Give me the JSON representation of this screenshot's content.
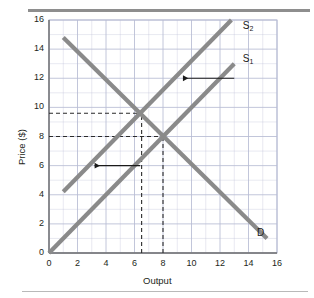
{
  "figure": {
    "title": "",
    "axis": {
      "x_title": "Output",
      "y_title": "Price ($)",
      "x_ticks": [
        "0",
        "2",
        "4",
        "6",
        "8",
        "10",
        "12",
        "14",
        "16"
      ],
      "y_ticks": [
        "0",
        "2",
        "4",
        "6",
        "8",
        "10",
        "12",
        "14",
        "16"
      ]
    },
    "labels": {
      "supply_1": "S",
      "supply_1_sub": "1",
      "supply_2": "S",
      "supply_2_sub": "2",
      "demand": "D"
    },
    "colors": {
      "curve": "#8a8a8a",
      "grid": "#b7bcd4",
      "axis": "#6e6e6e",
      "text": "#231f20",
      "dash": "#2a2a2a",
      "arrow": "#1a1a1a",
      "rule_top": "#8e8e8e",
      "rule_bottom": "#b9b9b9"
    }
  },
  "chart_data": {
    "type": "line",
    "xlabel": "Output",
    "ylabel": "Price ($)",
    "xlim": [
      0,
      16
    ],
    "ylim": [
      0,
      16
    ],
    "xticks": [
      0,
      2,
      4,
      6,
      8,
      10,
      12,
      14,
      16
    ],
    "yticks": [
      0,
      2,
      4,
      6,
      8,
      10,
      12,
      14,
      16
    ],
    "grid": true,
    "minor_grid_step": 1,
    "major_grid_step": 2,
    "legend": "inline-labels",
    "series": [
      {
        "name": "D",
        "label": "D",
        "label_point": [
          14.6,
          1.4
        ],
        "points": [
          [
            1.0,
            14.8
          ],
          [
            15.3,
            1.0
          ]
        ],
        "slope": -0.965,
        "intercept": 15.77
      },
      {
        "name": "S1",
        "label": "S₁",
        "label_point": [
          13.6,
          13.3
        ],
        "points": [
          [
            0.0,
            0.0
          ],
          [
            13.0,
            13.0
          ]
        ],
        "slope": 1.0,
        "intercept": 0.0
      },
      {
        "name": "S2",
        "label": "S₂",
        "label_point": [
          13.6,
          15.6
        ],
        "points": [
          [
            1.0,
            4.2
          ],
          [
            12.8,
            16.0
          ]
        ],
        "slope": 1.0,
        "intercept": 3.2
      }
    ],
    "equilibria": [
      {
        "name": "original",
        "on": "S1",
        "x": 8.0,
        "y": 8.0
      },
      {
        "name": "after-shift",
        "on": "S2",
        "x": 6.5,
        "y": 9.6
      }
    ],
    "guides": [
      {
        "type": "dashed-horizontal",
        "y": 8.0,
        "from_x": 0,
        "to_x": 8.0
      },
      {
        "type": "dashed-horizontal",
        "y": 9.6,
        "from_x": 0,
        "to_x": 6.5
      },
      {
        "type": "dashed-vertical",
        "x": 8.0,
        "from_y": 0,
        "to_y": 8.0
      },
      {
        "type": "dashed-vertical",
        "x": 6.5,
        "from_y": 0,
        "to_y": 9.6
      }
    ],
    "annotations": [
      {
        "type": "arrow",
        "direction": "left",
        "y": 12.0,
        "from_x": 13.0,
        "to_x": 9.4,
        "meaning": "supply curve shifts left"
      },
      {
        "type": "arrow",
        "direction": "left",
        "y": 6.0,
        "from_x": 6.4,
        "to_x": 3.2,
        "meaning": "supply curve shifts left"
      }
    ]
  }
}
